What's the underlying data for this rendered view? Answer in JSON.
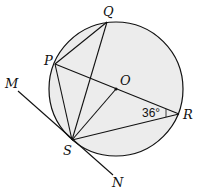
{
  "diagram": {
    "type": "circle-geometry",
    "colors": {
      "stroke": "#111111",
      "circle_fill": "#ececec",
      "background": "#ffffff"
    },
    "circle": {
      "center_label": "O",
      "cx": 116,
      "cy": 89,
      "r": 67
    },
    "points": {
      "Q": {
        "label": "Q",
        "x": 107,
        "y": 22
      },
      "P": {
        "label": "P",
        "x": 55,
        "y": 64
      },
      "O": {
        "label": "O",
        "x": 116,
        "y": 89
      },
      "R": {
        "label": "R",
        "x": 179,
        "y": 114
      },
      "S": {
        "label": "S",
        "x": 72,
        "y": 140
      },
      "M": {
        "label": "M",
        "x": 18,
        "y": 91
      },
      "N": {
        "label": "N",
        "x": 113,
        "y": 175
      }
    },
    "segments": [
      "PQ",
      "QS",
      "PS",
      "PR",
      "OS",
      "SR",
      "MN (tangent at S)"
    ],
    "angle": {
      "at": "R",
      "between": "PR, SR",
      "label": "36°"
    }
  }
}
